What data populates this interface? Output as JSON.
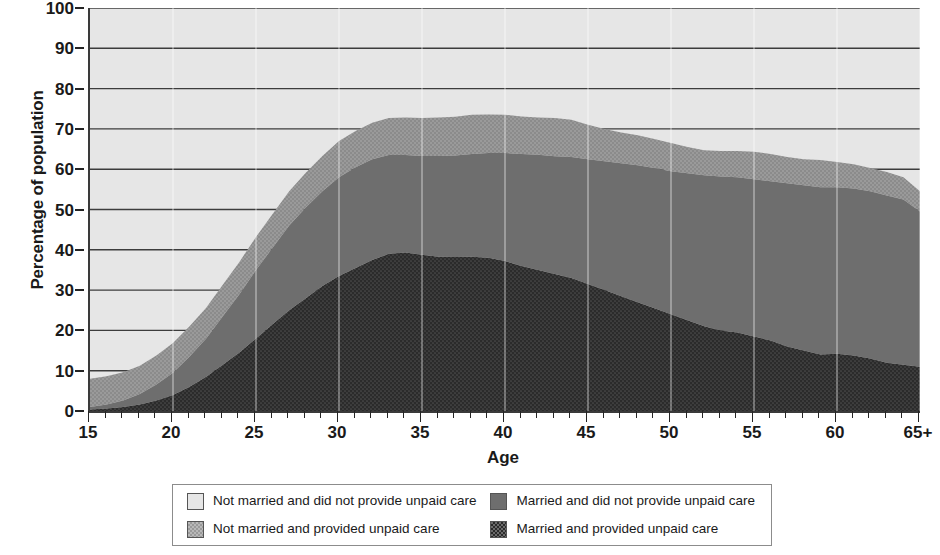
{
  "chart_data": {
    "type": "area",
    "title": "",
    "subtitle": "",
    "xlabel": "Age",
    "ylabel": "Percentage of population",
    "stacked": true,
    "grid": true,
    "legend_position": "bottom",
    "xlim": [
      15,
      65
    ],
    "ylim": [
      0,
      100
    ],
    "ytick_values": [
      0,
      10,
      20,
      30,
      40,
      50,
      60,
      70,
      80,
      90,
      100
    ],
    "xtick_labels": [
      "15",
      "20",
      "25",
      "30",
      "35",
      "40",
      "45",
      "50",
      "55",
      "60",
      "65+"
    ],
    "xtick_values": [
      15,
      20,
      25,
      30,
      35,
      40,
      45,
      50,
      55,
      60,
      65
    ],
    "x": [
      15,
      16,
      17,
      18,
      19,
      20,
      21,
      22,
      23,
      24,
      25,
      26,
      27,
      28,
      29,
      30,
      31,
      32,
      33,
      34,
      35,
      36,
      37,
      38,
      39,
      40,
      41,
      42,
      43,
      44,
      45,
      46,
      47,
      48,
      49,
      50,
      51,
      52,
      53,
      54,
      55,
      56,
      57,
      58,
      59,
      60,
      61,
      62,
      63,
      64,
      65
    ],
    "series": [
      {
        "name": "Married and provided unpaid care",
        "color": "#2b2b2b",
        "stack_order": 1,
        "values": [
          0.4,
          0.6,
          1.0,
          1.6,
          2.6,
          4.0,
          6.0,
          8.5,
          11.5,
          14.5,
          18.0,
          21.5,
          25.0,
          28.0,
          31.0,
          33.5,
          35.5,
          37.5,
          39.0,
          39.3,
          38.8,
          38.3,
          38.2,
          38.3,
          38.0,
          37.2,
          36.0,
          35.0,
          34.0,
          33.0,
          31.5,
          30.0,
          28.5,
          27.0,
          25.5,
          24.0,
          22.5,
          21.0,
          20.0,
          19.5,
          18.5,
          17.5,
          16.0,
          15.0,
          14.0,
          14.2,
          13.8,
          13.0,
          12.0,
          11.5,
          11.0
        ]
      },
      {
        "name": "Married and did not provide unpaid care",
        "color": "#6e6e6e",
        "stack_order": 2,
        "values": [
          0.6,
          1.0,
          1.6,
          2.6,
          4.0,
          5.5,
          7.5,
          9.5,
          12.0,
          14.5,
          17.0,
          19.0,
          21.0,
          22.5,
          23.5,
          24.5,
          25.0,
          25.0,
          24.5,
          24.2,
          24.5,
          25.0,
          25.2,
          25.5,
          26.0,
          26.8,
          27.8,
          28.6,
          29.2,
          30.0,
          31.0,
          32.0,
          33.0,
          34.0,
          34.8,
          35.5,
          36.5,
          37.5,
          38.2,
          38.5,
          39.0,
          39.5,
          40.5,
          41.0,
          41.5,
          41.3,
          41.4,
          41.5,
          41.5,
          41.0,
          38.5
        ]
      },
      {
        "name": "Not married and provided unpaid care",
        "color": "#9a9a9a",
        "stack_order": 3,
        "values": [
          7.0,
          7.0,
          7.0,
          7.0,
          7.2,
          7.4,
          7.5,
          7.6,
          7.8,
          8.0,
          8.2,
          8.4,
          8.5,
          8.6,
          8.8,
          9.0,
          9.0,
          9.0,
          9.2,
          9.3,
          9.4,
          9.5,
          9.6,
          9.7,
          9.6,
          9.5,
          9.3,
          9.2,
          9.5,
          9.3,
          8.5,
          8.0,
          7.6,
          7.4,
          7.2,
          7.0,
          6.5,
          6.2,
          6.3,
          6.5,
          6.8,
          6.8,
          6.5,
          6.5,
          6.8,
          6.3,
          6.0,
          5.8,
          5.8,
          5.5,
          5.0
        ]
      },
      {
        "name": "Not married and did not provide unpaid care",
        "color": "#e6e6e6",
        "stack_order": 4,
        "values": [
          92.0,
          91.4,
          90.4,
          88.8,
          86.2,
          83.1,
          79.0,
          74.4,
          68.7,
          63.0,
          56.8,
          51.1,
          45.5,
          40.9,
          36.7,
          33.0,
          30.5,
          28.5,
          27.3,
          27.2,
          27.3,
          27.2,
          27.0,
          26.5,
          26.4,
          26.5,
          26.9,
          27.2,
          27.3,
          27.7,
          29.0,
          30.0,
          30.9,
          31.6,
          32.5,
          33.5,
          34.5,
          35.3,
          35.5,
          35.5,
          35.7,
          36.2,
          37.0,
          37.5,
          37.7,
          38.2,
          38.8,
          39.7,
          40.7,
          42.0,
          45.5
        ]
      }
    ]
  },
  "legend": {
    "entries": [
      {
        "label": "Not married and did not provide unpaid care",
        "color": "#e6e6e6"
      },
      {
        "label": "Married and did not provide unpaid care",
        "color": "#6e6e6e"
      },
      {
        "label": "Not married and provided unpaid care",
        "color": "#9a9a9a"
      },
      {
        "label": "Married and provided unpaid care",
        "color": "#2b2b2b"
      }
    ]
  },
  "axes": {
    "y_title": "Percentage of population",
    "x_title": "Age"
  }
}
